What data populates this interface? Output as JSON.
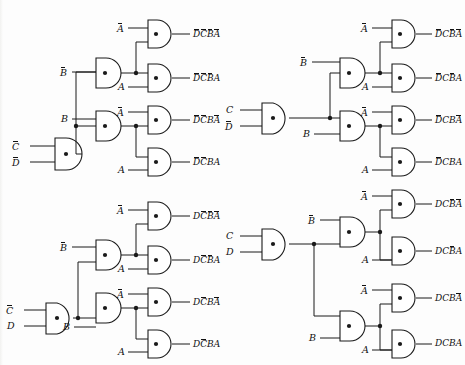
{
  "diagram": {
    "gate_symbol": "and-gate",
    "gate_marker": "dot",
    "line_color": "#1a1a1a",
    "background": "#fdfdfd"
  },
  "quadrants": [
    {
      "id": "top-left",
      "first_gate": {
        "inputs": [
          "C̄",
          "D̄"
        ],
        "position": "bottom"
      },
      "b_gates": [
        {
          "input": "B̄",
          "row": "upper"
        },
        {
          "input": "B",
          "row": "lower"
        }
      ],
      "outputs": [
        {
          "a_input": "Ā",
          "label_tokens": [
            "D",
            "C",
            "B",
            "A"
          ],
          "bars": [
            true,
            true,
            true,
            true
          ],
          "text": "D̄C̄B̄Ā"
        },
        {
          "a_input": "A",
          "label_tokens": [
            "D",
            "C",
            "B",
            "A"
          ],
          "bars": [
            true,
            true,
            true,
            false
          ],
          "text": "D̄C̄B̄A"
        },
        {
          "a_input": "Ā",
          "label_tokens": [
            "D",
            "C",
            "B",
            "A"
          ],
          "bars": [
            true,
            true,
            false,
            true
          ],
          "text": "D̄C̄BĀ"
        },
        {
          "a_input": "A",
          "label_tokens": [
            "D",
            "C",
            "B",
            "A"
          ],
          "bars": [
            true,
            true,
            false,
            false
          ],
          "text": "D̄C̄BA"
        }
      ]
    },
    {
      "id": "top-right",
      "first_gate": {
        "inputs": [
          "C",
          "D̄"
        ],
        "position": "middle"
      },
      "b_gates": [
        {
          "input": "B̄",
          "row": "upper"
        },
        {
          "input": "B",
          "row": "lower"
        }
      ],
      "outputs": [
        {
          "a_input": "Ā",
          "label_tokens": [
            "D",
            "C",
            "B",
            "A"
          ],
          "bars": [
            true,
            false,
            true,
            true
          ],
          "text": "D̄CB̄Ā"
        },
        {
          "a_input": "A",
          "label_tokens": [
            "D",
            "C",
            "B",
            "A"
          ],
          "bars": [
            true,
            false,
            true,
            false
          ],
          "text": "D̄CB̄A"
        },
        {
          "a_input": "Ā",
          "label_tokens": [
            "D",
            "C",
            "B",
            "A"
          ],
          "bars": [
            true,
            false,
            false,
            true
          ],
          "text": "D̄CBĀ"
        },
        {
          "a_input": "A",
          "label_tokens": [
            "D",
            "C",
            "B",
            "A"
          ],
          "bars": [
            true,
            false,
            false,
            false
          ],
          "text": "D̄CBA"
        }
      ]
    },
    {
      "id": "bottom-left",
      "first_gate": {
        "inputs": [
          "C̄",
          "D"
        ],
        "position": "bottom"
      },
      "b_gates": [
        {
          "input": "B̄",
          "row": "upper"
        },
        {
          "input": "B",
          "row": "lower"
        }
      ],
      "outputs": [
        {
          "a_input": "Ā",
          "label_tokens": [
            "D",
            "C",
            "B",
            "A"
          ],
          "bars": [
            false,
            true,
            true,
            true
          ],
          "text": "DC̄B̄Ā"
        },
        {
          "a_input": "A",
          "label_tokens": [
            "D",
            "C",
            "B",
            "A"
          ],
          "bars": [
            false,
            true,
            true,
            false
          ],
          "text": "DC̄B̄A"
        },
        {
          "a_input": "Ā",
          "label_tokens": [
            "D",
            "C",
            "B",
            "A"
          ],
          "bars": [
            false,
            true,
            false,
            true
          ],
          "text": "DC̄BĀ"
        },
        {
          "a_input": "A",
          "label_tokens": [
            "D",
            "C",
            "B",
            "A"
          ],
          "bars": [
            false,
            true,
            false,
            false
          ],
          "text": "DC̄BA"
        }
      ]
    },
    {
      "id": "bottom-right",
      "first_gate": {
        "inputs": [
          "C",
          "D"
        ],
        "position": "top"
      },
      "b_gates": [
        {
          "input": "B̄",
          "row": "upper"
        },
        {
          "input": "B",
          "row": "lower"
        }
      ],
      "outputs": [
        {
          "a_input": "Ā",
          "label_tokens": [
            "D",
            "C",
            "B",
            "A"
          ],
          "bars": [
            false,
            false,
            true,
            true
          ],
          "text": "DCB̄Ā"
        },
        {
          "a_input": "A",
          "label_tokens": [
            "D",
            "C",
            "B",
            "A"
          ],
          "bars": [
            false,
            false,
            true,
            false
          ],
          "text": "DCB̄A"
        },
        {
          "a_input": "Ā",
          "label_tokens": [
            "D",
            "C",
            "B",
            "A"
          ],
          "bars": [
            false,
            false,
            false,
            true
          ],
          "text": "DCBĀ"
        },
        {
          "a_input": "A",
          "label_tokens": [
            "D",
            "C",
            "B",
            "A"
          ],
          "bars": [
            false,
            false,
            false,
            false
          ],
          "text": "DCBA"
        }
      ]
    }
  ]
}
